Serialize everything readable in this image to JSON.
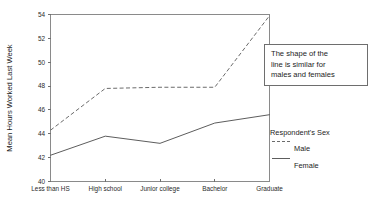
{
  "chart_data": {
    "type": "line",
    "title": "",
    "xlabel": "",
    "ylabel": "Mean Hours Worked Last Week",
    "categories": [
      "Less than HS",
      "High school",
      "Junior college",
      "Bachelor",
      "Graduate"
    ],
    "series": [
      {
        "name": "Male",
        "style": "dashed",
        "color": "#6b6b6b",
        "values": [
          44.3,
          47.8,
          47.9,
          47.9,
          53.9
        ]
      },
      {
        "name": "Female",
        "style": "solid",
        "color": "#5d5d5d",
        "values": [
          42.2,
          43.8,
          43.2,
          44.9,
          45.6
        ]
      }
    ],
    "ylim": [
      40,
      54
    ],
    "yticks": [
      40,
      42,
      44,
      46,
      48,
      50,
      52,
      54
    ],
    "ytick_labels": [
      "40",
      "42",
      "44",
      "46",
      "48",
      "50",
      "52",
      "54"
    ],
    "grid": false,
    "legend": {
      "position": "right",
      "title": "Respondent's Sex",
      "entries": [
        {
          "label": "Male",
          "style": "dashed"
        },
        {
          "label": "Female",
          "style": "solid"
        }
      ]
    },
    "annotations": [
      {
        "text": "The shape of the\nline is similar for\nmales and females",
        "position": "top-right",
        "boxed": true
      }
    ]
  }
}
